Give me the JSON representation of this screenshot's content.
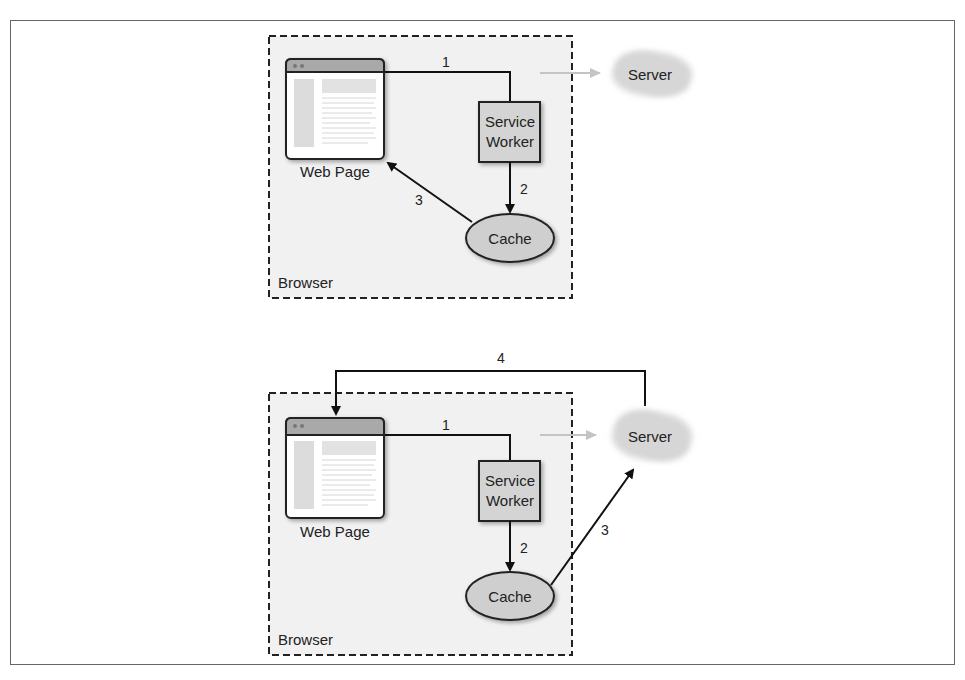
{
  "colors": {
    "frame_border": "#555555",
    "browser_fill": "#f1f1f1",
    "box_fill": "#d4d4d4",
    "cloud_fill": "#d8d8d8",
    "line": "#111111",
    "faded_line": "#bfbfbf",
    "titlebar": "#a9a9a9"
  },
  "diagrams": [
    {
      "browser_label": "Browser",
      "web_page_label": "Web Page",
      "service_worker_label_line1": "Service",
      "service_worker_label_line2": "Worker",
      "cache_label": "Cache",
      "server_label": "Server",
      "steps": [
        "1",
        "2",
        "3"
      ]
    },
    {
      "browser_label": "Browser",
      "web_page_label": "Web Page",
      "service_worker_label_line1": "Service",
      "service_worker_label_line2": "Worker",
      "cache_label": "Cache",
      "server_label": "Server",
      "steps": [
        "1",
        "2",
        "3",
        "4"
      ]
    }
  ]
}
